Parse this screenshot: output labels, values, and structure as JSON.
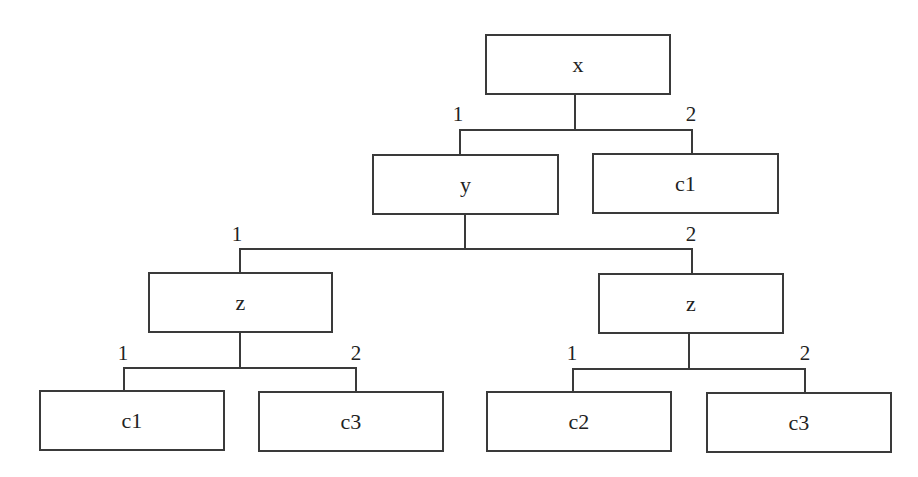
{
  "diagram": {
    "type": "decision-tree",
    "nodes": {
      "root": {
        "label": "x"
      },
      "n_y": {
        "label": "y"
      },
      "leaf_c1_top": {
        "label": "c1"
      },
      "n_z_left": {
        "label": "z"
      },
      "n_z_right": {
        "label": "z"
      },
      "leaf_c1_bottom": {
        "label": "c1"
      },
      "leaf_c3_left": {
        "label": "c3"
      },
      "leaf_c2": {
        "label": "c2"
      },
      "leaf_c3_right": {
        "label": "c3"
      }
    },
    "edges": {
      "root_1": {
        "label": "1",
        "from": "x",
        "to": "y"
      },
      "root_2": {
        "label": "2",
        "from": "x",
        "to": "c1"
      },
      "y_1": {
        "label": "1",
        "from": "y",
        "to": "z"
      },
      "y_2": {
        "label": "2",
        "from": "y",
        "to": "z"
      },
      "zl_1": {
        "label": "1",
        "from": "z",
        "to": "c1"
      },
      "zl_2": {
        "label": "2",
        "from": "z",
        "to": "c3"
      },
      "zr_1": {
        "label": "1",
        "from": "z",
        "to": "c2"
      },
      "zr_2": {
        "label": "2",
        "from": "z",
        "to": "c3"
      }
    }
  }
}
